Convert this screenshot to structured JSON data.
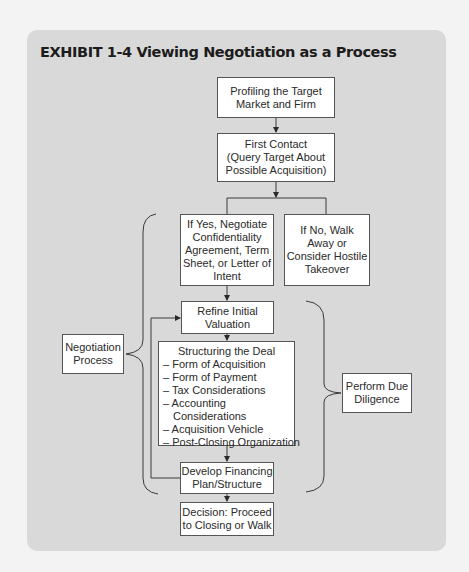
{
  "exhibit": {
    "title": "EXHIBIT 1-4  Viewing Negotiation as a Process"
  },
  "colors": {
    "page_bg": "#f3f3f3",
    "card_bg": "#d9d9d9",
    "box_bg": "#ffffff",
    "line": "#3a3a3a"
  },
  "nodes": {
    "profiling": "Profiling the Target\nMarket and Firm",
    "first_contact": "First Contact\n(Query Target About\nPossible Acquisition)",
    "if_yes": "If Yes, Negotiate\nConfidentiality\nAgreement, Term\nSheet, or Letter of\nIntent",
    "if_no": "If No, Walk\nAway or\nConsider Hostile\nTakeover",
    "refine": "Refine Initial\nValuation",
    "structuring": {
      "heading": "Structuring the Deal",
      "items": [
        "– Form of Acquisition",
        "– Form of Payment",
        "– Tax Considerations",
        "– Accounting",
        "Considerations",
        "– Acquisition Vehicle",
        "– Post-Closing Organization"
      ]
    },
    "financing": "Develop Financing\nPlan/Structure",
    "decision": "Decision: Proceed\nto Closing or Walk",
    "negotiation_process": "Negotiation\nProcess",
    "due_diligence": "Perform Due\nDiligence"
  }
}
